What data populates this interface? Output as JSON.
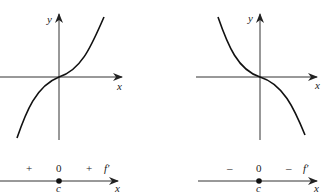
{
  "left_panel": {
    "graph": {
      "y_label": "y",
      "x_label": "x",
      "curve": "increasing cubic with horizontal tangent at origin"
    },
    "sign_chart": {
      "signs": [
        "+",
        "0",
        "+"
      ],
      "function_label": "f′",
      "critical_point_label": "c",
      "axis_label": "x"
    }
  },
  "right_panel": {
    "graph": {
      "y_label": "y",
      "x_label": "x",
      "curve": "decreasing cubic with horizontal tangent at origin"
    },
    "sign_chart": {
      "signs": [
        "–",
        "0",
        "–"
      ],
      "function_label": "f′",
      "critical_point_label": "c",
      "axis_label": "x"
    }
  },
  "colors": {
    "ink": "#222222",
    "background": "#ffffff"
  }
}
